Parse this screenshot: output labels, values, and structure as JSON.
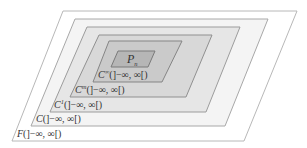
{
  "diagram": {
    "layers": [
      {
        "id": "F",
        "base": "F",
        "superscript": "",
        "interval": "(]−∞, ∞[)",
        "fill": "#ffffff",
        "stroke": "#b8b8b8"
      },
      {
        "id": "C",
        "base": "C",
        "superscript": "",
        "interval": "(]−∞, ∞[)",
        "fill": "#f4f4f4",
        "stroke": "#a8a8a8"
      },
      {
        "id": "C1",
        "base": "C",
        "superscript": "1",
        "interval": "(]−∞, ∞[)",
        "fill": "#e6e6e6",
        "stroke": "#9c9c9c"
      },
      {
        "id": "Cm",
        "base": "C",
        "superscript": "m",
        "interval": "(]−∞, ∞[)",
        "fill": "#d8d8d8",
        "stroke": "#909090"
      },
      {
        "id": "Cinf",
        "base": "C",
        "superscript": "∞",
        "interval": "(]−∞, ∞[)",
        "fill": "#cacaca",
        "stroke": "#858585"
      }
    ],
    "core": {
      "base": "P",
      "subscript": "n",
      "fill": "#b6b6b6",
      "stroke": "#7a7a7a"
    }
  }
}
